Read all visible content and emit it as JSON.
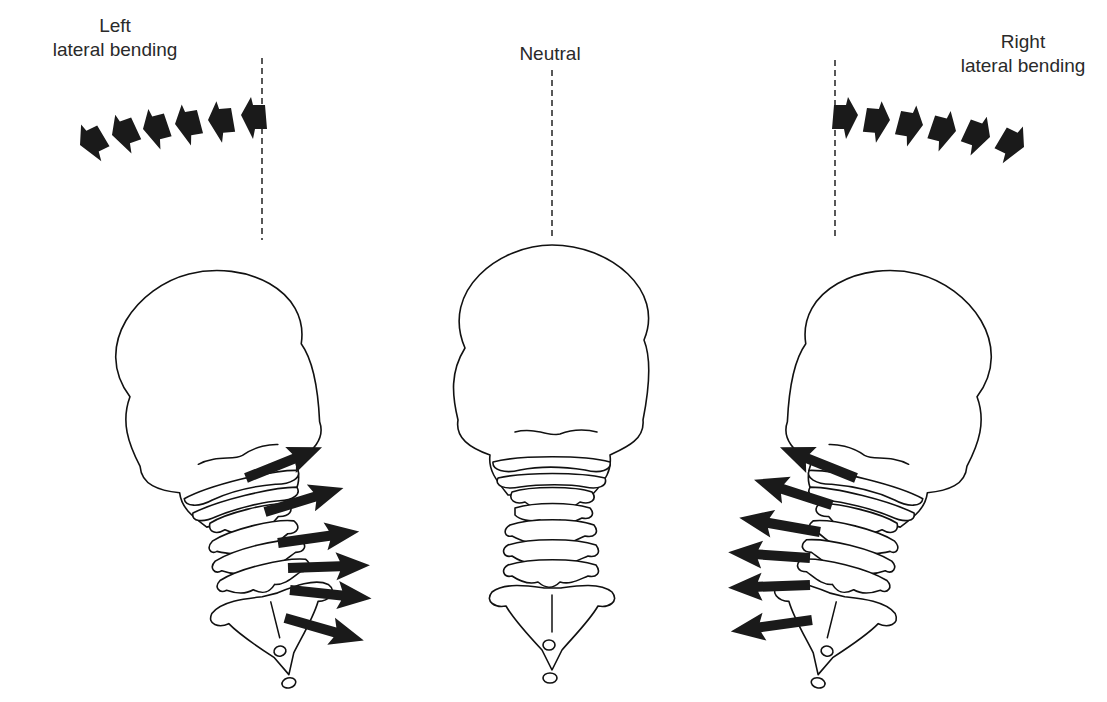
{
  "figure": {
    "panels": [
      {
        "id": "left",
        "label_line1": "Left",
        "label_line2": "lateral bending",
        "motion_direction": "left",
        "head_tilt": "left",
        "vertebral_arrows": 6,
        "arrow_direction": "right"
      },
      {
        "id": "neutral",
        "label_line1": "Neutral",
        "label_line2": "",
        "motion_direction": "none",
        "head_tilt": "none",
        "vertebral_arrows": 0
      },
      {
        "id": "right",
        "label_line1": "Right",
        "label_line2": "lateral bending",
        "motion_direction": "right",
        "head_tilt": "right",
        "vertebral_arrows": 6,
        "arrow_direction": "left"
      }
    ],
    "motion_chevrons_per_side": 6,
    "colors": {
      "ink": "#111111",
      "arrow_fill": "#1a1a1a",
      "background": "#ffffff"
    }
  }
}
